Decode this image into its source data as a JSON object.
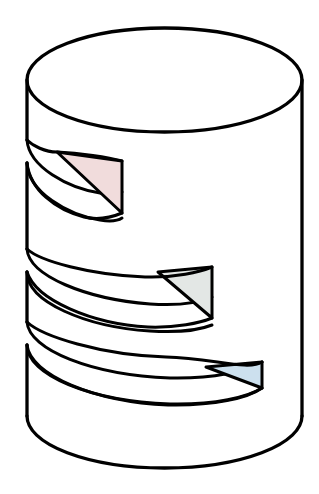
{
  "illustration": {
    "title": "Helical grooved cylinder",
    "description": "Line drawing of an upright cylinder cut by three helical grooves, each terminating in a shaded triangular end face.",
    "background_color": "#ffffff",
    "line_color": "#000000",
    "body_fill": "#ffffff",
    "line_width_outer": 3.2,
    "line_width_inner": 2.6
  },
  "geometry": {
    "cylinder": {
      "left_x": 27,
      "right_x": 302,
      "top_ellipse_center_y": 80,
      "top_ellipse_rx": 137.5,
      "top_ellipse_ry": 52,
      "bottom_arc_center_y": 416,
      "bottom_arc_rx": 137.5,
      "bottom_arc_ry": 52,
      "width": 275,
      "height": 440
    },
    "grooves": [
      {
        "id": "groove-1",
        "order": 1,
        "upper_start_y": 136,
        "lower_start_y": 190,
        "end_face_right_x": 122,
        "end_face_top_y": 161,
        "end_face_bottom_y": 213
      },
      {
        "id": "groove-2",
        "order": 2,
        "upper_start_y": 244,
        "lower_start_y": 298,
        "end_face_right_x": 212,
        "end_face_top_y": 267,
        "end_face_bottom_y": 318
      },
      {
        "id": "groove-3",
        "order": 3,
        "upper_start_y": 345,
        "lower_start_y": 398,
        "end_face_right_x": 262,
        "end_face_top_y": 362,
        "end_face_bottom_y": 408
      }
    ]
  },
  "end_faces": [
    {
      "name": "upper-end-face",
      "groove": "groove-1",
      "color_label": "pink",
      "fill": "#F1DCDC",
      "stroke": "#000000"
    },
    {
      "name": "middle-end-face",
      "groove": "groove-2",
      "color_label": "gray",
      "fill": "#E3E7E5",
      "stroke": "#000000"
    },
    {
      "name": "lower-end-face",
      "groove": "groove-3",
      "color_label": "light-blue",
      "fill": "#CCE0EE",
      "stroke": "#000000"
    }
  ]
}
